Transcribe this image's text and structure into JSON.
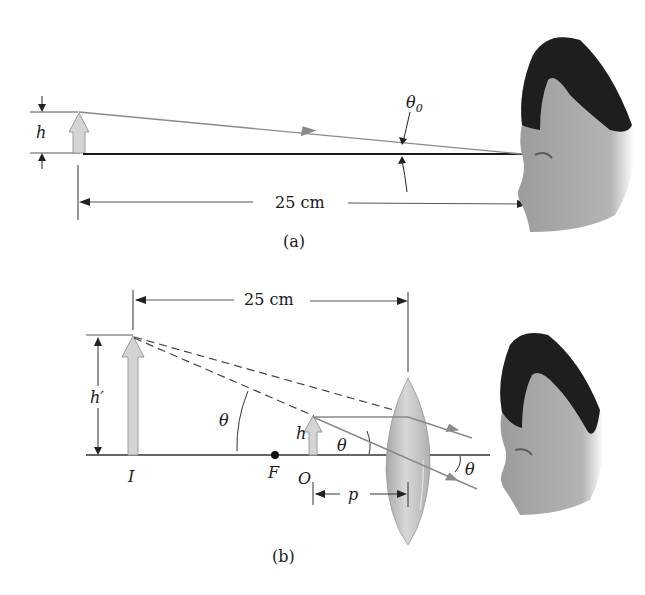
{
  "figure": {
    "panel_a": {
      "caption": "(a)",
      "labels": {
        "object_height": "h",
        "angle": "θ",
        "angle_subscript": "0",
        "distance": "25 cm"
      }
    },
    "panel_b": {
      "caption": "(b)",
      "labels": {
        "distance": "25 cm",
        "image_height": "h′",
        "object_height": "h",
        "angle_image": "θ",
        "angle_object": "θ",
        "angle_exit": "θ",
        "image_point": "I",
        "focal_point": "F",
        "object_point": "O",
        "object_distance": "p"
      }
    },
    "colors": {
      "ray": "#8a8a8a",
      "axis": "#1a1a1a",
      "arrow_fill": "#d4d4d4",
      "arrow_stroke": "#9a9a9a",
      "lens_fill": "#c8c8c8",
      "hair": "#1e1e1e",
      "skin": "#a8a8a8"
    }
  }
}
